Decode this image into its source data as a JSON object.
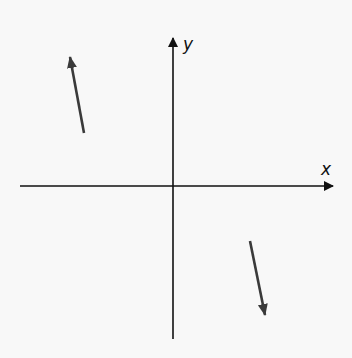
{
  "diagram": {
    "type": "coordinate-axes-with-vectors",
    "axes": {
      "x_label": "x",
      "y_label": "y",
      "origin": [
        173,
        186
      ],
      "x_axis": {
        "from": [
          20,
          186
        ],
        "to": [
          333,
          186
        ]
      },
      "y_axis": {
        "from": [
          173,
          339
        ],
        "to": [
          173,
          38
        ]
      }
    },
    "vectors": [
      {
        "name": "upper-left-vector",
        "quadrant": "II",
        "from": [
          84,
          133
        ],
        "to": [
          70,
          57
        ],
        "color": "#3a3a3a"
      },
      {
        "name": "lower-right-vector",
        "quadrant": "IV",
        "from": [
          250,
          241
        ],
        "to": [
          265,
          315
        ],
        "color": "#3a3a3a"
      }
    ],
    "colors": {
      "axis": "#111111",
      "vector": "#3a3a3a",
      "background": "#f8f8f8"
    }
  }
}
